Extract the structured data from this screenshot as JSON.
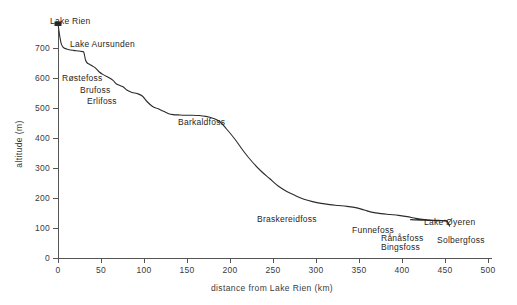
{
  "chart_data": {
    "type": "line",
    "title": "",
    "xlabel": "distance from Lake Rien (km)",
    "ylabel": "altitude (m)",
    "xlim": [
      0,
      525
    ],
    "ylim": [
      0,
      780
    ],
    "grid": false,
    "legend": "none",
    "x_ticks": [
      0,
      50,
      100,
      150,
      200,
      250,
      300,
      350,
      400,
      450,
      500
    ],
    "y_ticks": [
      0,
      100,
      200,
      300,
      400,
      500,
      600,
      700
    ],
    "x_tick_labels": [
      "0",
      "50",
      "100",
      "150",
      "200",
      "250",
      "300",
      "350",
      "400",
      "450",
      "500"
    ],
    "y_tick_labels": [
      "0",
      "100",
      "200",
      "300",
      "400",
      "500",
      "600",
      "700"
    ],
    "series": [
      {
        "name": "Glomma river longitudinal profile",
        "x": [
          0,
          2,
          4,
          7,
          12,
          18,
          24,
          28,
          30,
          32,
          34,
          37,
          40,
          44,
          48,
          52,
          56,
          60,
          64,
          68,
          72,
          76,
          80,
          86,
          92,
          98,
          104,
          110,
          116,
          122,
          128,
          134,
          140,
          148,
          156,
          164,
          172,
          180,
          188,
          196,
          206,
          216,
          226,
          236,
          246,
          256,
          266,
          276,
          286,
          296,
          306,
          316,
          326,
          336,
          346,
          356,
          366,
          376,
          386,
          396,
          406,
          416,
          426,
          436,
          446,
          452,
          455,
          455,
          452,
          446,
          436,
          426,
          416,
          410
        ],
        "y": [
          780,
          740,
          712,
          700,
          695,
          692,
          690,
          688,
          686,
          660,
          650,
          645,
          640,
          632,
          620,
          612,
          606,
          600,
          592,
          580,
          575,
          570,
          560,
          552,
          548,
          540,
          520,
          505,
          498,
          490,
          482,
          478,
          477,
          476,
          476,
          475,
          472,
          466,
          455,
          430,
          395,
          355,
          320,
          290,
          265,
          240,
          222,
          208,
          196,
          188,
          182,
          178,
          175,
          172,
          168,
          160,
          152,
          148,
          145,
          142,
          138,
          132,
          128,
          126,
          125,
          124,
          108,
          108,
          122,
          124,
          125,
          126,
          127,
          128
        ]
      }
    ],
    "annotations": [
      {
        "name": "Lake Rien",
        "label": "Lake Rien",
        "x_km": 0,
        "altitude_m": 780
      },
      {
        "name": "Lake Aursunden",
        "label": "Lake Aursunden",
        "x_km": 24,
        "altitude_m": 690
      },
      {
        "name": "Røstefoss",
        "label": "Røstefoss",
        "x_km": 52,
        "altitude_m": 612
      },
      {
        "name": "Brufoss",
        "label": "Brufoss",
        "x_km": 72,
        "altitude_m": 575
      },
      {
        "name": "Erlifoss",
        "label": "Erlifoss",
        "x_km": 86,
        "altitude_m": 552
      },
      {
        "name": "Barkaldfoss",
        "label": "Barkaldfoss",
        "x_km": 165,
        "altitude_m": 472
      },
      {
        "name": "Braskereidfoss",
        "label": "Braskereidfoss",
        "x_km": 300,
        "altitude_m": 180
      },
      {
        "name": "Funnefoss",
        "label": "Funnefoss",
        "x_km": 370,
        "altitude_m": 150
      },
      {
        "name": "Rånåsfoss",
        "label": "Rånåsfoss",
        "x_km": 400,
        "altitude_m": 138
      },
      {
        "name": "Bingsfoss",
        "label": "Bingsfoss",
        "x_km": 405,
        "altitude_m": 135
      },
      {
        "name": "Lake Øyeren",
        "label": "Lake Øyeren",
        "x_km": 440,
        "altitude_m": 125
      },
      {
        "name": "Solbergfoss",
        "label": "Solbergfoss",
        "x_km": 455,
        "altitude_m": 108
      }
    ]
  },
  "labels": {
    "lake_rien": "Lake Rien",
    "lake_aursunden": "Lake Aursunden",
    "rostefoss": "Røstefoss",
    "brufoss": "Brufoss",
    "erlifoss": "Erlifoss",
    "barkaldfoss": "Barkaldfoss",
    "braskereidfoss": "Braskereidfoss",
    "funnefoss": "Funnefoss",
    "ranasfoss": "Rånåsfoss",
    "bingsfoss": "Bingsfoss",
    "lake_oyeren": "Lake Øyeren",
    "solbergfoss": "Solbergfoss"
  },
  "axes": {
    "y_title": "altitude (m)",
    "x_title": "distance from Lake Rien (km)",
    "y_tick_labels": [
      "700",
      "600",
      "500",
      "400",
      "300",
      "200",
      "100",
      "0"
    ],
    "x_tick_labels": [
      "0",
      "50",
      "100",
      "150",
      "200",
      "250",
      "300",
      "350",
      "400",
      "450",
      "500"
    ]
  },
  "colors": {
    "line": "#2b2b2b",
    "axis": "#555555",
    "text": "#1f1f1f",
    "background": "#ffffff"
  }
}
